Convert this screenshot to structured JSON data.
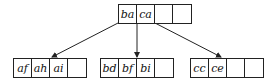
{
  "diagram": {
    "type": "B-tree",
    "root": {
      "keys": [
        "ba",
        "ca",
        "",
        ""
      ]
    },
    "children": [
      {
        "keys": [
          "af",
          "ah",
          "ai",
          ""
        ]
      },
      {
        "keys": [
          "bd",
          "bf",
          "bi",
          ""
        ]
      },
      {
        "keys": [
          "cc",
          "ce",
          "",
          ""
        ]
      }
    ]
  }
}
